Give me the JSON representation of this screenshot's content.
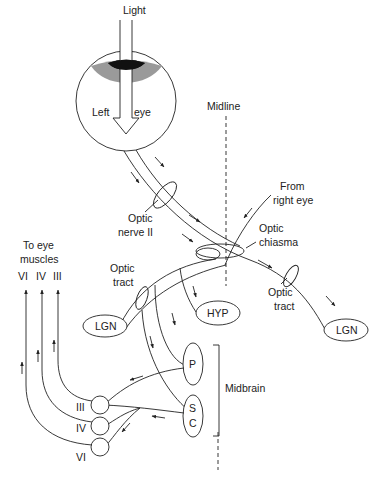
{
  "labels": {
    "light": "Light",
    "left": "Left",
    "eye": "eye",
    "midline": "Midline",
    "optic_nerve_1": "Optic",
    "optic_nerve_2": "nerve II",
    "from_right_1": "From",
    "from_right_2": "right eye",
    "optic_chiasma_1": "Optic",
    "optic_chiasma_2": "chiasma",
    "optic_tract_left_1": "Optic",
    "optic_tract_left_2": "tract",
    "optic_tract_right_1": "Optic",
    "optic_tract_right_2": "tract",
    "to_eye_1": "To eye",
    "to_eye_2": "muscles",
    "nerve_vi_top": "VI",
    "nerve_iv_top": "IV",
    "nerve_iii_top": "III",
    "lgn_left": "LGN",
    "lgn_right": "LGN",
    "hyp": "HYP",
    "p": "P",
    "sc_s": "S",
    "sc_c": "C",
    "midbrain": "Midbrain",
    "nucleus_iii": "III",
    "nucleus_iv": "IV",
    "nucleus_vi": "VI"
  },
  "colors": {
    "line": "#222222",
    "iris_dark": "#111111",
    "iris_gray": "#9a9a9a"
  }
}
